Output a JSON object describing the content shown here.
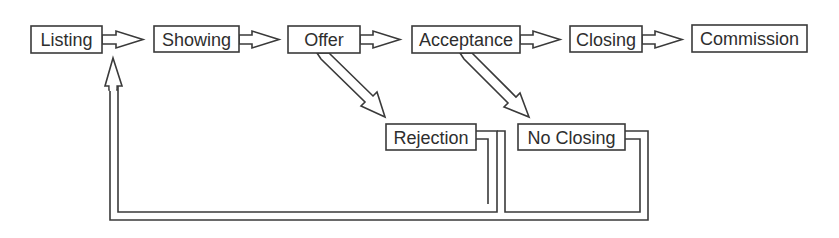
{
  "diagram": {
    "type": "flowchart",
    "colors": {
      "stroke": "#3a3a3a",
      "text": "#2e2e2e",
      "background": "#ffffff"
    },
    "nodes": [
      {
        "id": "listing",
        "label": "Listing"
      },
      {
        "id": "showing",
        "label": "Showing"
      },
      {
        "id": "offer",
        "label": "Offer"
      },
      {
        "id": "acceptance",
        "label": "Acceptance"
      },
      {
        "id": "closing",
        "label": "Closing"
      },
      {
        "id": "commission",
        "label": "Commission"
      },
      {
        "id": "rejection",
        "label": "Rejection"
      },
      {
        "id": "no_closing",
        "label": "No Closing"
      }
    ],
    "edges": [
      {
        "from": "Listing",
        "to": "Showing"
      },
      {
        "from": "Showing",
        "to": "Offer"
      },
      {
        "from": "Offer",
        "to": "Acceptance"
      },
      {
        "from": "Acceptance",
        "to": "Closing"
      },
      {
        "from": "Closing",
        "to": "Commission"
      },
      {
        "from": "Offer",
        "to": "Rejection"
      },
      {
        "from": "Acceptance",
        "to": "No Closing"
      },
      {
        "from": "Rejection",
        "to": "Listing"
      },
      {
        "from": "No Closing",
        "to": "Listing"
      }
    ]
  }
}
